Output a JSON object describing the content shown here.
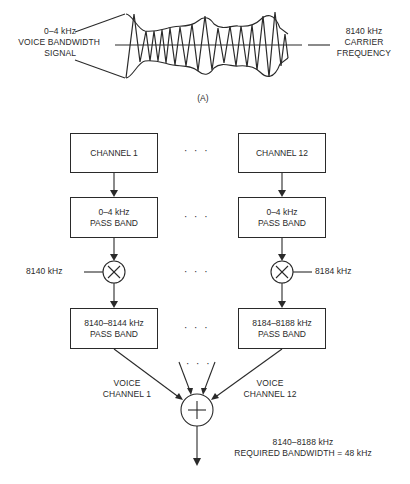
{
  "panel_a": {
    "caption": "(A)",
    "left_label": [
      "0–4 kHz",
      "VOICE BANDWIDTH",
      "SIGNAL"
    ],
    "right_label": [
      "8140 kHz",
      "CARRIER",
      "FREQUENCY"
    ]
  },
  "panel_b": {
    "channels": [
      {
        "source": "CHANNEL 1",
        "filter": [
          "0–4 kHz",
          "PASS BAND"
        ],
        "carrier": "8140 kHz",
        "output_filter": [
          "8140–8144 kHz",
          "PASS BAND"
        ],
        "voice_label": [
          "VOICE",
          "CHANNEL 1"
        ]
      },
      {
        "source": "CHANNEL 12",
        "filter": [
          "0–4 kHz",
          "PASS BAND"
        ],
        "carrier": "8184 kHz",
        "output_filter": [
          "8184–8188 kHz",
          "PASS BAND"
        ],
        "voice_label": [
          "VOICE",
          "CHANNEL 12"
        ]
      }
    ],
    "ellipsis": "· · ·",
    "mixer_symbol": "×",
    "summer_symbol": "+",
    "output_label": [
      "8140–8188 kHz",
      "REQUIRED BANDWIDTH = 48 kHz"
    ]
  }
}
